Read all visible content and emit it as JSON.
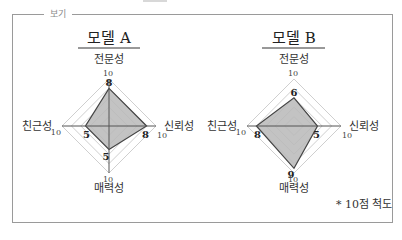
{
  "legend_label": "보기",
  "note": "* 10점 척도",
  "chart_data": [
    {
      "type": "radar",
      "title": "모델 A",
      "axes": [
        "전문성",
        "신뢰성",
        "매력성",
        "친근성"
      ],
      "max": 10,
      "values": [
        8,
        8,
        5,
        5
      ],
      "tick_labels": [
        "10",
        "10",
        "10",
        "10"
      ],
      "grid_levels": 5
    },
    {
      "type": "radar",
      "title": "모델 B",
      "axes": [
        "전문성",
        "신뢰성",
        "매력성",
        "친근성"
      ],
      "max": 10,
      "values": [
        6,
        5,
        9,
        8
      ],
      "tick_labels": [
        "10",
        "10",
        "10",
        "10"
      ],
      "grid_levels": 5
    }
  ],
  "colors": {
    "fill": "#b8b8b8",
    "stroke": "#444444",
    "grid": "#cfcfcf",
    "frame": "#9a9a9a"
  }
}
